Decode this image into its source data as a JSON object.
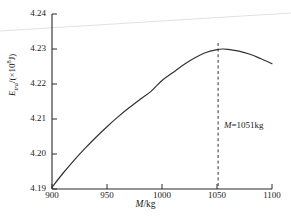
{
  "chart_data": {
    "type": "line",
    "title": "",
    "xlabel": "M/kg",
    "ylabel": "E_tra/(×10⁸J)",
    "ylabel_base": "E",
    "ylabel_sub": "tra",
    "ylabel_unit_prefix": "/(×10",
    "ylabel_unit_exp": "8",
    "ylabel_unit_suffix": "J)",
    "xlabel_symbol": "M",
    "xlabel_unit": "/kg",
    "xlim": [
      900,
      1100
    ],
    "ylim": [
      4.19,
      4.24
    ],
    "xticks": [
      900,
      950,
      1000,
      1050,
      1100
    ],
    "xtick_labels": [
      "900",
      "950",
      "1000",
      "1050",
      "1100"
    ],
    "yticks": [
      4.19,
      4.2,
      4.21,
      4.22,
      4.23,
      4.24
    ],
    "ytick_labels": [
      "4.19",
      "4.20",
      "4.21",
      "4.22",
      "4.23",
      "4.24"
    ],
    "grid": false,
    "legend": null,
    "line_color": "#333333",
    "annotation_line_color": "#333333",
    "series": [
      {
        "name": "E_tra",
        "x": [
          900,
          910,
          920,
          930,
          940,
          950,
          960,
          970,
          980,
          990,
          1000,
          1010,
          1020,
          1030,
          1040,
          1050,
          1055,
          1060,
          1070,
          1080,
          1090,
          1100
        ],
        "values": [
          4.1905,
          4.1945,
          4.1982,
          4.2016,
          4.2048,
          4.2078,
          4.2106,
          4.2132,
          4.2156,
          4.2179,
          4.221,
          4.2233,
          4.2256,
          4.2275,
          4.229,
          4.2298,
          4.23,
          4.2299,
          4.2294,
          4.2285,
          4.2272,
          4.2258
        ]
      }
    ],
    "annotations": [
      {
        "name": "optimal-mass-marker",
        "type": "vline",
        "x": 1051,
        "style": "dashed",
        "label": "M=1051kg",
        "label_symbol": "M",
        "label_rest": "=1051kg"
      }
    ]
  },
  "artifacts": {
    "scan_line_color": "#e2e2e2"
  }
}
